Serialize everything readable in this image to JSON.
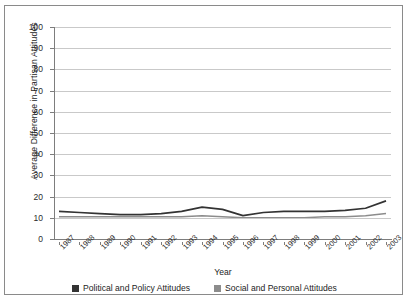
{
  "chart_data": {
    "type": "line",
    "title": "",
    "xlabel": "Year",
    "ylabel": "Average  Difference in Partisan Attitudes",
    "categories": [
      "1987",
      "1988",
      "1989",
      "1990",
      "1991",
      "1992",
      "1993",
      "1994",
      "1995",
      "1996",
      "1997",
      "1998",
      "1999",
      "2000",
      "2001",
      "2002",
      "2003"
    ],
    "yticks": [
      0,
      10,
      20,
      30,
      40,
      50,
      60,
      70,
      80,
      90,
      100
    ],
    "ylim": [
      0,
      100
    ],
    "grid": true,
    "legend_position": "bottom",
    "series": [
      {
        "name": "Political and Policy Attitudes",
        "color": "#333333",
        "values": [
          13,
          12.5,
          12,
          11.5,
          11.5,
          12,
          13,
          15,
          14,
          11,
          12.5,
          13,
          13,
          13,
          13.5,
          14.5,
          18
        ]
      },
      {
        "name": "Social and Personal Attitudes",
        "color": "#8c8c8c",
        "values": [
          10.5,
          10.5,
          10.5,
          10.5,
          10.5,
          10.5,
          10.5,
          11,
          10.5,
          10,
          10,
          10,
          10,
          10.5,
          10.5,
          11,
          12
        ]
      }
    ]
  },
  "legend": {
    "items": [
      {
        "label": "Political and Policy Attitudes",
        "color": "#333333"
      },
      {
        "label": "Social and Personal Attitudes",
        "color": "#8c8c8c"
      }
    ]
  }
}
